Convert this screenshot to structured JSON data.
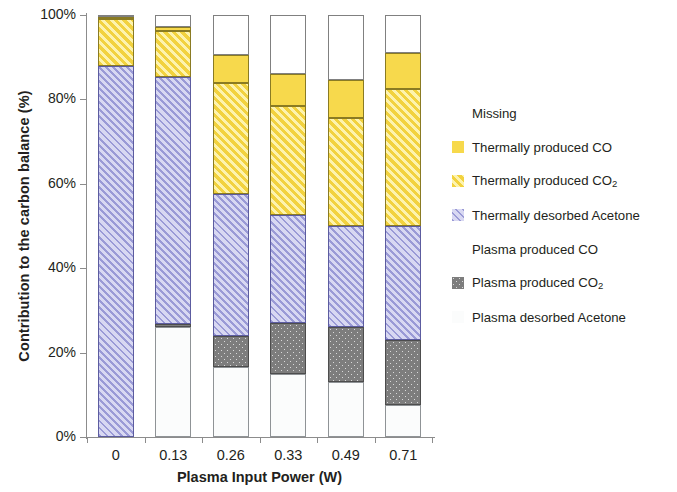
{
  "chart_data": {
    "type": "bar",
    "stacked": true,
    "title": "",
    "xlabel": "Plasma Input Power (W)",
    "ylabel": "Contribution to the carbon balance (%)",
    "categories": [
      "0",
      "0.13",
      "0.26",
      "0.33",
      "0.49",
      "0.71"
    ],
    "ylim": [
      0,
      100
    ],
    "ytick_labels": [
      "0%",
      "20%",
      "40%",
      "60%",
      "80%",
      "100%"
    ],
    "ytick_values": [
      0,
      20,
      40,
      60,
      80,
      100
    ],
    "grid": false,
    "legend_position": "right",
    "series": [
      {
        "name": "Plasma desorbed Acetone",
        "key": "plasma_desorbed_acetone",
        "fill": "white-outline",
        "color": "#FBFCFC",
        "values": [
          0,
          26,
          16.5,
          15,
          13,
          7.5
        ]
      },
      {
        "name": "Plasma produced  CO2",
        "key": "plasma_produced_co2",
        "fill": "dark-gray-dotted",
        "color": "#7D7D7D",
        "values": [
          0,
          0.8,
          7.5,
          12,
          13,
          15.5
        ]
      },
      {
        "name": "Plasma produced CO",
        "key": "plasma_produced_co",
        "fill": "white-outline",
        "color": "#FFFFFF",
        "values": [
          0,
          0,
          0,
          0,
          0,
          0
        ]
      },
      {
        "name": "Thermally desorbed Acetone",
        "key": "thermally_desorbed_acetone",
        "fill": "purple-hatched",
        "color": "#9A9AD6",
        "values": [
          88,
          58.5,
          33.5,
          25.5,
          24,
          27
        ]
      },
      {
        "name": "Thermally produced  CO2",
        "key": "thermally_produced_co2",
        "fill": "yellow-hatched",
        "color": "#F2D23F",
        "values": [
          11,
          11,
          26.5,
          26,
          25.5,
          32.5
        ]
      },
      {
        "name": "Thermally produced CO",
        "key": "thermally_produced_co",
        "fill": "yellow-solid",
        "color": "#F7D94C",
        "values": [
          0.5,
          0.8,
          6.5,
          7.5,
          9,
          8.5
        ]
      },
      {
        "name": "Missing",
        "key": "missing",
        "fill": "white-outline",
        "color": "#FFFFFF",
        "values": [
          0.5,
          3,
          9.5,
          14,
          15.5,
          9
        ]
      }
    ]
  },
  "axes": {
    "y_title": "Contribution to the carbon balance (%)",
    "x_title": "Plasma Input Power (W)",
    "y_ticks": [
      "100%",
      "80%",
      "60%",
      "40%",
      "20%",
      "0%"
    ],
    "x_ticks": [
      "0",
      "0.13",
      "0.26",
      "0.33",
      "0.49",
      "0.71"
    ]
  },
  "legend": {
    "items": [
      {
        "label": "Missing",
        "label_sub": "",
        "swatch": "missing"
      },
      {
        "label": "Thermally produced CO",
        "label_sub": "",
        "swatch": "thermco"
      },
      {
        "label": "Thermally produced  CO",
        "label_sub": "2",
        "swatch": "thermco2"
      },
      {
        "label": "Thermally desorbed Acetone",
        "label_sub": "",
        "swatch": "thermacet"
      },
      {
        "label": "Plasma produced CO",
        "label_sub": "",
        "swatch": "plasmaco"
      },
      {
        "label": "Plasma produced  CO",
        "label_sub": "2",
        "swatch": "plasmaco2"
      },
      {
        "label": "Plasma desorbed Acetone",
        "label_sub": "",
        "swatch": "plasmaacet"
      }
    ]
  }
}
